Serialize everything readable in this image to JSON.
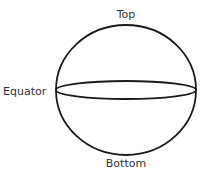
{
  "diagram": {
    "labels": {
      "top": "Top",
      "equator": "Equator",
      "bottom": "Bottom"
    },
    "colors": {
      "stroke": "#1a1a1a",
      "text": "#333333",
      "background": "#ffffff"
    }
  }
}
